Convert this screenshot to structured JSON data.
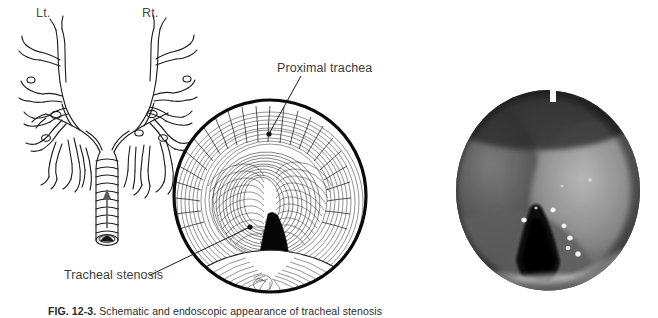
{
  "figure": {
    "caption_label": "FIG. 12-3.",
    "caption_text": "Schematic and endoscopic appearance of tracheal stenosis"
  },
  "panel_tree": {
    "name": "Bronchial tree schematic",
    "left_label": "Lt.",
    "right_label": "Rt.",
    "arrow_name": "viewing-direction-arrow"
  },
  "panel_schematic": {
    "name": "Bronchoscopic schematic view",
    "labels": [
      {
        "id": "proximal-trachea",
        "text": "Proximal trachea"
      },
      {
        "id": "tracheal-stenosis",
        "text": "Tracheal stenosis"
      }
    ]
  },
  "panel_photo": {
    "name": "Endoscopic photograph of tracheal stenosis"
  },
  "colors": {
    "ink": "#1a1a1a",
    "label_gray": "#4a4a4a",
    "paper": "#ffffff",
    "lumen_black": "#000000"
  }
}
